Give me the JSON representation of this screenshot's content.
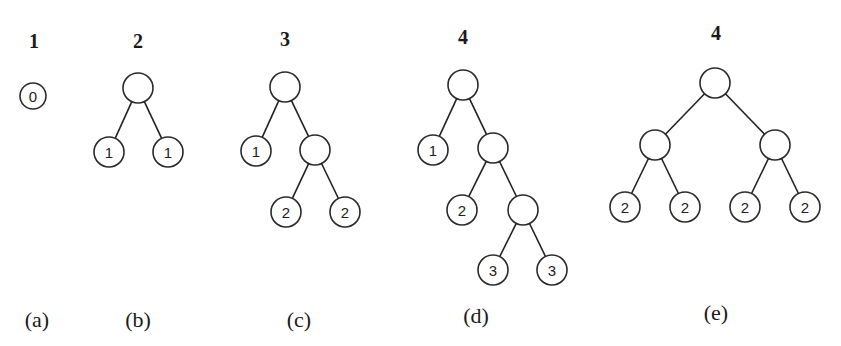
{
  "figure": {
    "colors": {
      "line": "#222222",
      "node_fill": "#ffffff",
      "text": "#1a1a1a"
    },
    "panels": [
      {
        "id": "a",
        "title": "1",
        "caption": "(a)",
        "title_pos": [
          34,
          48
        ],
        "caption_pos": [
          37,
          327
        ],
        "nodes": [
          {
            "x": 33,
            "y": 96,
            "r": 13,
            "label": "0"
          }
        ],
        "edges": []
      },
      {
        "id": "b",
        "title": "2",
        "caption": "(b)",
        "title_pos": [
          138,
          48
        ],
        "caption_pos": [
          138,
          327
        ],
        "nodes": [
          {
            "x": 138,
            "y": 88,
            "r": 15,
            "label": ""
          },
          {
            "x": 109,
            "y": 152,
            "r": 15,
            "label": "1"
          },
          {
            "x": 168,
            "y": 152,
            "r": 15,
            "label": "1"
          }
        ],
        "edges": [
          [
            0,
            1
          ],
          [
            0,
            2
          ]
        ]
      },
      {
        "id": "c",
        "title": "3",
        "caption": "(c)",
        "title_pos": [
          285,
          46
        ],
        "caption_pos": [
          299,
          327
        ],
        "nodes": [
          {
            "x": 285,
            "y": 87,
            "r": 15,
            "label": ""
          },
          {
            "x": 256,
            "y": 151,
            "r": 15,
            "label": "1"
          },
          {
            "x": 315,
            "y": 150,
            "r": 15,
            "label": ""
          },
          {
            "x": 286,
            "y": 212,
            "r": 15,
            "label": "2"
          },
          {
            "x": 345,
            "y": 212,
            "r": 15,
            "label": "2"
          }
        ],
        "edges": [
          [
            0,
            1
          ],
          [
            0,
            2
          ],
          [
            2,
            3
          ],
          [
            2,
            4
          ]
        ]
      },
      {
        "id": "d",
        "title": "4",
        "caption": "(d)",
        "title_pos": [
          463,
          44
        ],
        "caption_pos": [
          476,
          323
        ],
        "nodes": [
          {
            "x": 463,
            "y": 85,
            "r": 15,
            "label": ""
          },
          {
            "x": 433,
            "y": 150,
            "r": 15,
            "label": "1"
          },
          {
            "x": 493,
            "y": 148,
            "r": 15,
            "label": ""
          },
          {
            "x": 462,
            "y": 210,
            "r": 15,
            "label": "2"
          },
          {
            "x": 523,
            "y": 210,
            "r": 15,
            "label": ""
          },
          {
            "x": 493,
            "y": 270,
            "r": 15,
            "label": "3"
          },
          {
            "x": 552,
            "y": 270,
            "r": 15,
            "label": "3"
          }
        ],
        "edges": [
          [
            0,
            1
          ],
          [
            0,
            2
          ],
          [
            2,
            3
          ],
          [
            2,
            4
          ],
          [
            4,
            5
          ],
          [
            4,
            6
          ]
        ]
      },
      {
        "id": "e",
        "title": "4",
        "caption": "(e)",
        "title_pos": [
          716,
          40
        ],
        "caption_pos": [
          716,
          320
        ],
        "nodes": [
          {
            "x": 715,
            "y": 83,
            "r": 15,
            "label": ""
          },
          {
            "x": 655,
            "y": 145,
            "r": 15,
            "label": ""
          },
          {
            "x": 775,
            "y": 145,
            "r": 15,
            "label": ""
          },
          {
            "x": 625,
            "y": 207,
            "r": 15,
            "label": "2"
          },
          {
            "x": 685,
            "y": 207,
            "r": 15,
            "label": "2"
          },
          {
            "x": 745,
            "y": 207,
            "r": 15,
            "label": "2"
          },
          {
            "x": 805,
            "y": 207,
            "r": 15,
            "label": "2"
          }
        ],
        "edges": [
          [
            0,
            1
          ],
          [
            0,
            2
          ],
          [
            1,
            3
          ],
          [
            1,
            4
          ],
          [
            2,
            5
          ],
          [
            2,
            6
          ]
        ]
      }
    ]
  }
}
